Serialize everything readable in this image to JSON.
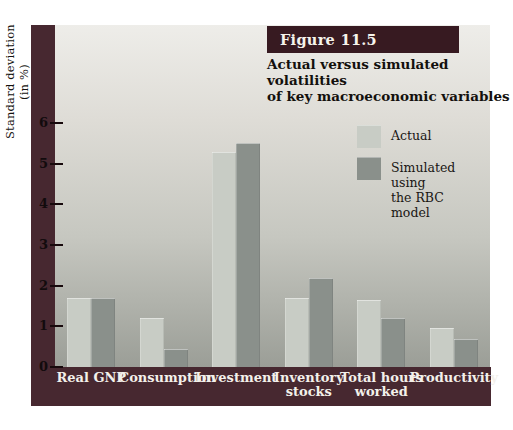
{
  "figure": {
    "label": "Figure 11.5",
    "title": "Actual versus simulated volatilities\nof key macroeconomic variables"
  },
  "legend": {
    "items": [
      {
        "label": "Actual",
        "color": "#c8ccc5"
      },
      {
        "label": "Simulated using\nthe RBC model",
        "color": "#8a908b"
      }
    ]
  },
  "chart_data": {
    "type": "bar",
    "title": "Actual versus simulated volatilities of key macroeconomic variables",
    "categories": [
      "Real GNP",
      "Consumption",
      "Investment",
      "Inventory stocks",
      "Total hours worked",
      "Productivity"
    ],
    "categories_display": [
      "Real GNP",
      "Consumption",
      "Investment",
      "Inventory\nstocks",
      "Total hours\nworked",
      "Productivity"
    ],
    "series": [
      {
        "name": "Actual",
        "color": "#c8ccc5",
        "values": [
          1.7,
          1.2,
          5.3,
          1.7,
          1.65,
          0.95
        ]
      },
      {
        "name": "Simulated using the RBC model",
        "color": "#8a908b",
        "values": [
          1.7,
          0.45,
          5.5,
          2.2,
          1.2,
          0.7
        ]
      }
    ],
    "xlabel": "",
    "ylabel": "Standard deviation (in %)",
    "ylim": [
      0,
      6
    ],
    "yticks": [
      0,
      1,
      2,
      3,
      4,
      5,
      6
    ],
    "grid": false,
    "legend_position": "upper-right"
  },
  "colors": {
    "band": "#472830",
    "figure_label_box": "#371a21",
    "plot_gradient_top": "#eeede9",
    "plot_gradient_bottom": "#9b9e97",
    "tick_text": "#120b0d",
    "category_label_text": "#f3f0ea",
    "title_text": "#13100d"
  }
}
